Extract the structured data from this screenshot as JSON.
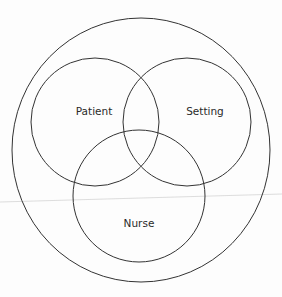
{
  "diagram": {
    "type": "venn",
    "outer_circle": {
      "cx": 141,
      "cy": 150,
      "rx": 129,
      "ry": 132
    },
    "circles": [
      {
        "label": "Patient",
        "cx": 95,
        "cy": 122,
        "r": 64,
        "label_x": 94,
        "label_y": 115
      },
      {
        "label": "Setting",
        "cx": 187,
        "cy": 122,
        "r": 64,
        "label_x": 205,
        "label_y": 115
      },
      {
        "label": "Nurse",
        "cx": 139,
        "cy": 196,
        "r": 66,
        "label_x": 139,
        "label_y": 227
      }
    ],
    "stroke_color": "#333333",
    "artifact_line_color": "#cfcfcf"
  }
}
